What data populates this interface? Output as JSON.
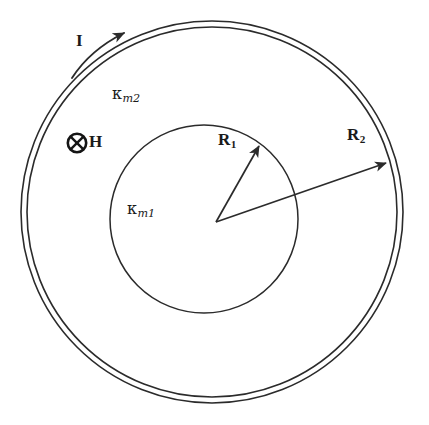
{
  "figure": {
    "stroke_color": "#2b2b2b",
    "background_color": "#ffffff",
    "labels": {
      "current": "I",
      "field": "H",
      "field_marker_icon": "circled-cross-icon",
      "inner_radius_symbol": "R",
      "inner_radius_subscript": "1",
      "outer_radius_symbol": "R",
      "outer_radius_subscript": "2",
      "kappa_symbol": "κ",
      "inner_medium_subscript": "m1",
      "outer_medium_subscript": "m2"
    },
    "geometry": {
      "outer_circle": {
        "cx": 212,
        "cy": 212,
        "r_outer": 191,
        "r_inner": 185
      },
      "inner_circle": {
        "cx": 204,
        "cy": 219,
        "r": 94
      },
      "vertex": {
        "x": 216,
        "y": 222
      },
      "r1_arrow_tip": {
        "x": 259,
        "y": 145
      },
      "r2_arrow_tip": {
        "x": 385,
        "y": 163
      },
      "current_arc": {
        "start": {
          "x": 72,
          "y": 77
        },
        "end": {
          "x": 123,
          "y": 33
        }
      }
    }
  }
}
